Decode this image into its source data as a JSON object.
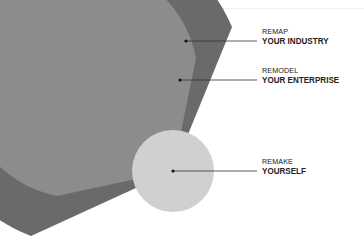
{
  "diagram": {
    "type": "concentric-fan",
    "layers": [
      {
        "id": "outer",
        "kicker": "REMAP",
        "title": "YOUR INDUSTRY",
        "color": "#6a6a6a"
      },
      {
        "id": "middle",
        "kicker": "REMODEL",
        "title": "YOUR ENTERPRISE",
        "color": "#8c8c8c"
      },
      {
        "id": "inner",
        "kicker": "REMAKE",
        "title": "YOURSELF",
        "color": "#d0d0d0"
      }
    ],
    "leader_color": "#222222"
  }
}
